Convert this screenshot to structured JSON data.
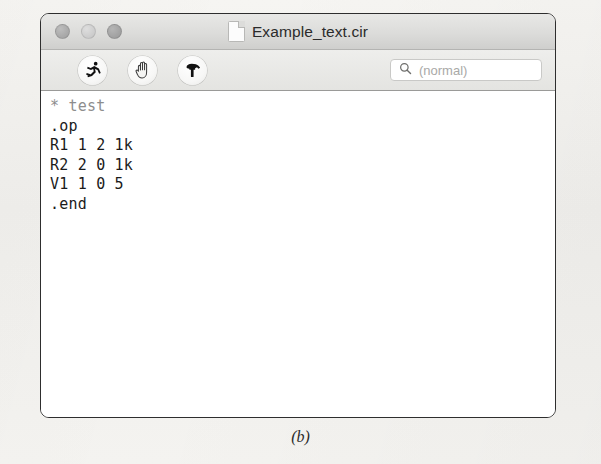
{
  "window": {
    "title": "Example_text.cir",
    "title_icon": "document-icon",
    "traffic_lights": [
      {
        "name": "close-button",
        "label": "Close"
      },
      {
        "name": "minimize-button",
        "label": "Minimize"
      },
      {
        "name": "zoom-button",
        "label": "Zoom"
      }
    ]
  },
  "toolbar": {
    "buttons": [
      {
        "name": "run-button",
        "icon": "running-man-icon",
        "label": "Run"
      },
      {
        "name": "stop-button",
        "icon": "hand-icon",
        "label": "Stop"
      },
      {
        "name": "build-button",
        "icon": "hammer-icon",
        "label": "Build"
      }
    ],
    "search": {
      "icon": "search-icon",
      "placeholder": "(normal)",
      "value": ""
    }
  },
  "editor": {
    "lines": [
      "* test",
      ".op",
      "R1 1 2 1k",
      "R2 2 0 1k",
      "V1 1 0 5",
      ".end"
    ]
  },
  "caption": "(b)",
  "colors": {
    "window_border": "#2e2e2e",
    "titlebar": "#dcdcda",
    "toolbar": "#e4e4e1",
    "editor_background": "#ffffff",
    "text": "#1b1b1b",
    "comment_text": "#8d8d8d",
    "placeholder_text": "#a9a9a7",
    "page_background": "#f2f2ef"
  }
}
